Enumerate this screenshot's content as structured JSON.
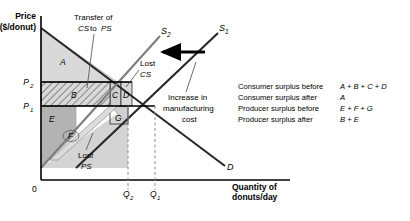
{
  "figure": {
    "axes": {
      "y_title_line1": "Price",
      "y_title_line2": "($/donut)",
      "x_title_line1": "Quantity of",
      "x_title_line2": "donuts/day",
      "origin_label": "0",
      "price_ticks": [
        {
          "label": "P",
          "sub": "2"
        },
        {
          "label": "P",
          "sub": "1"
        }
      ],
      "quantity_ticks": [
        {
          "label": "Q",
          "sub": "2"
        },
        {
          "label": "Q",
          "sub": "1"
        }
      ]
    },
    "curves": [
      {
        "name": "supply-shifted",
        "label": "S",
        "sub": "2"
      },
      {
        "name": "supply-original",
        "label": "S",
        "sub": "1"
      },
      {
        "name": "demand",
        "label": "D",
        "sub": ""
      }
    ],
    "annotations": {
      "transfer": {
        "line1": "Transfer of",
        "line2_a": "CS",
        "line2_b": "to",
        "line2_c": "PS"
      },
      "lost_cs": {
        "line1": "Lost",
        "line2": "CS"
      },
      "lost_ps": {
        "line1": "Lost",
        "line2": "PS"
      },
      "increase_cost": {
        "line1": "Increase in",
        "line2": "manufacturing",
        "line3": "cost"
      }
    },
    "regions": [
      {
        "id": "A",
        "letter": "A"
      },
      {
        "id": "B",
        "letter": "B"
      },
      {
        "id": "C",
        "letter": "C"
      },
      {
        "id": "D",
        "letter": "D"
      },
      {
        "id": "E",
        "letter": "E"
      },
      {
        "id": "F",
        "letter": "F"
      },
      {
        "id": "G",
        "letter": "G"
      }
    ],
    "legend": {
      "rows": [
        {
          "label": "Consumer surplus before",
          "value": "A + B + C + D"
        },
        {
          "label": "Consumer surplus after",
          "value": "A"
        },
        {
          "label": "Producer surplus before",
          "value": "E + F + G"
        },
        {
          "label": "Producer surplus after",
          "value": "B + E"
        }
      ]
    },
    "colors": {
      "region_light": "#d9d9d9",
      "region_mid": "#cccccc",
      "region_dark": "#b3b3b3",
      "line": "#1a1a1a",
      "curve_gray": "#808080",
      "border": "#9a9a9a"
    }
  }
}
